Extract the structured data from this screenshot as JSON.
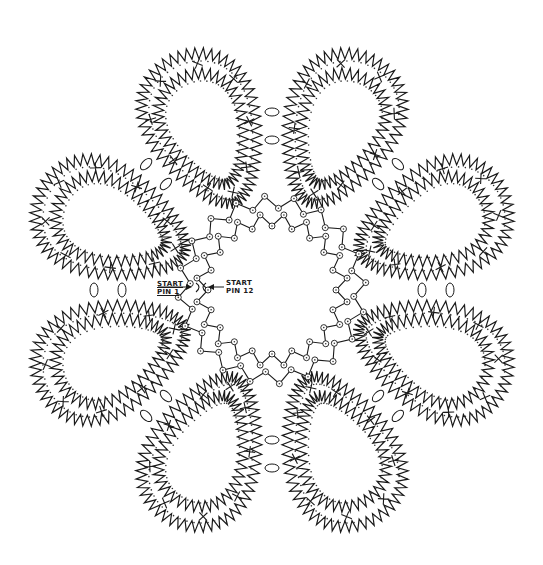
{
  "diagram": {
    "type": "bobbin-lace-pricking",
    "center": [
      272,
      290
    ],
    "petal_count": 8,
    "petal_angles_deg": [
      -67.5,
      -22.5,
      22.5,
      67.5,
      112.5,
      157.5,
      202.5,
      247.5
    ],
    "petal_inner_radius": 95,
    "petal_outer_radius": 270,
    "petal_half_width": 70,
    "zigzag_amplitude": 7,
    "zigzag_step": 9,
    "inner_ring_radius": 70,
    "inner_ring_pins": 40,
    "stroke_color": "#1a1a1a",
    "pin_color": "#333333",
    "background_color": "#ffffff"
  },
  "labels": {
    "start_pin_1": {
      "line1": "START",
      "line2": "PIN 1"
    },
    "start_pin_12": {
      "line1": "START",
      "line2": "PIN 12"
    }
  },
  "legend_symbols": {
    "cross": "X (cloth stitch crossing)",
    "oval": "oval (join / sewing marker)",
    "circled_pin": "circled pin hole"
  }
}
